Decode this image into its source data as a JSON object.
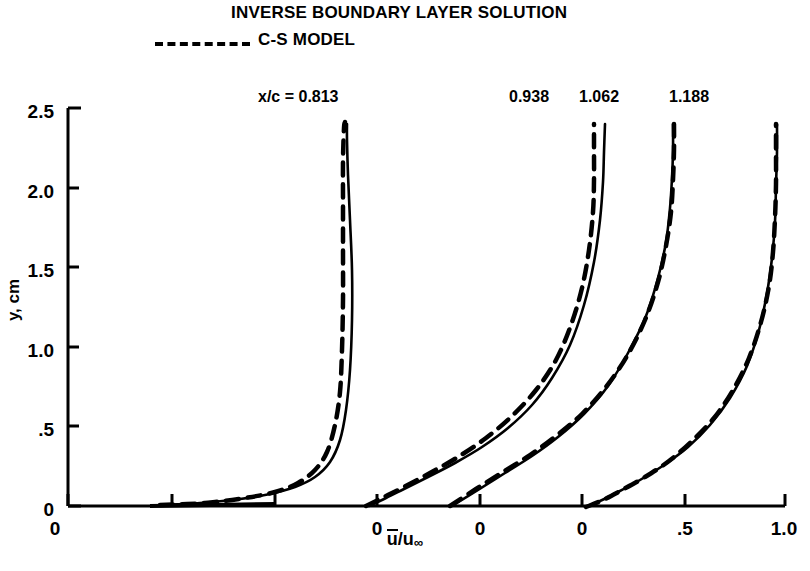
{
  "header": {
    "title": "INVERSE BOUNDARY LAYER SOLUTION",
    "legend_label": "C-S MODEL",
    "legend_style": "dashed"
  },
  "axes": {
    "y_label": "y, cm",
    "x_label_html": "u/u∞",
    "y_ticks": [
      "2.5",
      "2.0",
      "1.5",
      "1.0",
      ".5",
      "0"
    ],
    "y_tick_values": [
      2.5,
      2.0,
      1.5,
      1.0,
      0.5,
      0.0
    ],
    "x_ticks": [
      "0",
      "0",
      "0",
      "0",
      ".5",
      "1.0"
    ],
    "x_tick_values": [
      0.0,
      0.0,
      0.0,
      0.0,
      0.5,
      1.0
    ]
  },
  "curve_labels": [
    {
      "text": "x/c = 0.813",
      "x": 258
    },
    {
      "text": "0.938",
      "x": 509
    },
    {
      "text": "1.062",
      "x": 579
    },
    {
      "text": "1.188",
      "x": 669
    }
  ],
  "chart_data": {
    "type": "line",
    "title": "INVERSE BOUNDARY LAYER SOLUTION",
    "xlabel": "u-bar / u-infinity",
    "ylabel": "y, cm",
    "ylim": [
      0,
      2.5
    ],
    "grid": false,
    "legend_position": "top-left",
    "stations": [
      {
        "name": "x/c = 0.813",
        "zero_px": 275,
        "series": [
          {
            "name": "inverse-solution",
            "style": "solid",
            "points_px": [
              [
                160,
                505
              ],
              [
                200,
                503
              ],
              [
                240,
                499
              ],
              [
                270,
                494
              ],
              [
                295,
                487
              ],
              [
                315,
                477
              ],
              [
                330,
                462
              ],
              [
                340,
                440
              ],
              [
                346,
                410
              ],
              [
                350,
                370
              ],
              [
                352,
                320
              ],
              [
                352,
                270
              ],
              [
                350,
                220
              ],
              [
                348,
                175
              ],
              [
                347,
                140
              ],
              [
                347,
                124
              ]
            ]
          },
          {
            "name": "c-s-model",
            "style": "dashed",
            "points_px": [
              [
                160,
                505
              ],
              [
                205,
                503
              ],
              [
                245,
                498
              ],
              [
                275,
                492
              ],
              [
                298,
                483
              ],
              [
                315,
                470
              ],
              [
                327,
                452
              ],
              [
                335,
                425
              ],
              [
                340,
                392
              ],
              [
                342,
                350
              ],
              [
                343,
                300
              ],
              [
                343,
                250
              ],
              [
                343,
                200
              ],
              [
                343,
                160
              ],
              [
                344,
                128
              ],
              [
                345,
                122
              ]
            ]
          }
        ]
      },
      {
        "name": "0.938",
        "zero_px": 377,
        "series": [
          {
            "name": "inverse-solution",
            "style": "solid",
            "points_px": [
              [
                369,
                506
              ],
              [
                386,
                498
              ],
              [
                404,
                489
              ],
              [
                428,
                477
              ],
              [
                455,
                463
              ],
              [
                482,
                447
              ],
              [
                508,
                428
              ],
              [
                532,
                405
              ],
              [
                552,
                378
              ],
              [
                570,
                345
              ],
              [
                584,
                305
              ],
              [
                594,
                262
              ],
              [
                600,
                220
              ],
              [
                603,
                182
              ],
              [
                604,
                152
              ],
              [
                605,
                124
              ]
            ]
          },
          {
            "name": "c-s-model",
            "style": "dashed",
            "points_px": [
              [
                366,
                506
              ],
              [
                384,
                497
              ],
              [
                404,
                487
              ],
              [
                430,
                473
              ],
              [
                458,
                457
              ],
              [
                486,
                438
              ],
              [
                512,
                416
              ],
              [
                536,
                390
              ],
              [
                556,
                360
              ],
              [
                571,
                325
              ],
              [
                582,
                288
              ],
              [
                589,
                250
              ],
              [
                593,
                212
              ],
              [
                594,
                180
              ],
              [
                594,
                150
              ],
              [
                594,
                124
              ]
            ]
          }
        ]
      },
      {
        "name": "1.062",
        "zero_px": 480,
        "series": [
          {
            "name": "inverse-solution",
            "style": "solid",
            "points_px": [
              [
                452,
                506
              ],
              [
                478,
                490
              ],
              [
                505,
                473
              ],
              [
                532,
                456
              ],
              [
                558,
                437
              ],
              [
                584,
                414
              ],
              [
                608,
                386
              ],
              [
                628,
                353
              ],
              [
                646,
                316
              ],
              [
                658,
                278
              ],
              [
                666,
                242
              ],
              [
                670,
                208
              ],
              [
                672,
                178
              ],
              [
                673,
                150
              ],
              [
                673,
                124
              ]
            ]
          },
          {
            "name": "c-s-model",
            "style": "dashed",
            "points_px": [
              [
                450,
                506
              ],
              [
                476,
                489
              ],
              [
                503,
                472
              ],
              [
                530,
                455
              ],
              [
                556,
                436
              ],
              [
                582,
                414
              ],
              [
                606,
                387
              ],
              [
                627,
                356
              ],
              [
                645,
                320
              ],
              [
                658,
                282
              ],
              [
                666,
                246
              ],
              [
                671,
                212
              ],
              [
                673,
                180
              ],
              [
                674,
                150
              ],
              [
                674,
                124
              ]
            ]
          }
        ]
      },
      {
        "name": "1.188",
        "zero_px": 582,
        "series": [
          {
            "name": "inverse-solution",
            "style": "solid",
            "points_px": [
              [
                585,
                507
              ],
              [
                600,
                501
              ],
              [
                618,
                492
              ],
              [
                640,
                480
              ],
              [
                664,
                465
              ],
              [
                688,
                447
              ],
              [
                710,
                425
              ],
              [
                730,
                398
              ],
              [
                747,
                366
              ],
              [
                759,
                330
              ],
              [
                767,
                293
              ],
              [
                772,
                258
              ],
              [
                775,
                222
              ],
              [
                776,
                186
              ],
              [
                777,
                152
              ],
              [
                777,
                124
              ]
            ]
          },
          {
            "name": "c-s-model",
            "style": "dashed",
            "points_px": [
              [
                586,
                507
              ],
              [
                603,
                500
              ],
              [
                622,
                490
              ],
              [
                645,
                477
              ],
              [
                669,
                461
              ],
              [
                692,
                441
              ],
              [
                714,
                418
              ],
              [
                733,
                390
              ],
              [
                749,
                358
              ],
              [
                761,
                322
              ],
              [
                769,
                286
              ],
              [
                773,
                252
              ],
              [
                775,
                218
              ],
              [
                776,
                184
              ],
              [
                776,
                152
              ],
              [
                776,
                124
              ]
            ]
          }
        ]
      }
    ]
  },
  "geometry": {
    "plot_left_px": 68,
    "plot_right_px": 785,
    "plot_top_px": 108,
    "plot_bottom_px": 506,
    "y_tick_px": [
      108,
      188,
      267,
      347,
      426,
      506
    ],
    "x_tick_px": [
      68,
      172,
      275,
      377,
      480,
      582,
      685,
      785
    ],
    "y_tick_label_px": [
      102,
      182,
      261,
      341,
      420,
      500
    ],
    "x_tick_label_px": [
      55,
      377,
      480,
      582,
      685,
      784
    ]
  }
}
